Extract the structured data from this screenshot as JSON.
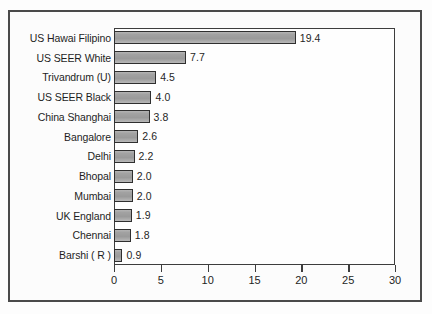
{
  "chart_data": {
    "type": "bar",
    "orientation": "horizontal",
    "title": "",
    "xlabel": "",
    "ylabel": "",
    "xlim": [
      0,
      30
    ],
    "xticks": [
      0,
      5,
      10,
      15,
      20,
      25,
      30
    ],
    "xtick_labels": [
      "0",
      "5",
      "10",
      "15",
      "20",
      "25",
      "30"
    ],
    "grid": false,
    "legend": null,
    "bar_color": "#a2a2a2",
    "bar_edge_color": "#2f2f2f",
    "categories": [
      "US Hawai Filipino",
      "US SEER White",
      "Trivandrum (U)",
      "US SEER Black",
      "China Shanghai",
      "Bangalore",
      "Delhi",
      "Bhopal",
      "Mumbai",
      "UK England",
      "Chennai",
      "Barshi ( R )"
    ],
    "values": [
      19.4,
      7.7,
      4.5,
      4.0,
      3.8,
      2.6,
      2.2,
      2.0,
      2.0,
      1.9,
      1.8,
      0.9
    ],
    "value_labels": [
      "19.4",
      "7.7",
      "4.5",
      "4.0",
      "3.8",
      "2.6",
      "2.2",
      "2.0",
      "2.0",
      "1.9",
      "1.8",
      "0.9"
    ]
  }
}
